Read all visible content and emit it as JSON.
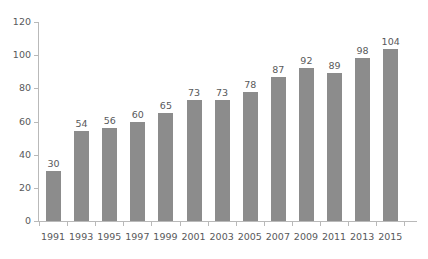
{
  "chart_data": {
    "type": "bar",
    "title": "",
    "subtitle": "",
    "xlabel": "",
    "ylabel": "",
    "categories": [
      "1991",
      "1993",
      "1995",
      "1997",
      "1999",
      "2001",
      "2003",
      "2005",
      "2007",
      "2009",
      "2011",
      "2013",
      "2015"
    ],
    "values": [
      30,
      54,
      56,
      60,
      65,
      73,
      73,
      78,
      87,
      92,
      89,
      98,
      104
    ],
    "value_labels": [
      "30",
      "54",
      "56",
      "60",
      "65",
      "73",
      "73",
      "78",
      "87",
      "92",
      "89",
      "98",
      "104"
    ],
    "ylim": [
      0,
      120
    ],
    "ytick_values": [
      0,
      20,
      40,
      60,
      80,
      100,
      120
    ],
    "ytick_labels": [
      "0",
      "20",
      "40",
      "60",
      "80",
      "100",
      "120"
    ],
    "grid": false,
    "legend": null,
    "legend_position": "none",
    "colors": {
      "bar": "#8c8c8c",
      "axis": "#b9b9b9",
      "text": "#58595b",
      "background": "#ffffff"
    }
  }
}
